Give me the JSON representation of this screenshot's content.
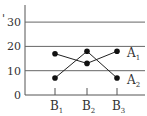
{
  "chart_data": {
    "type": "line",
    "title": "",
    "xlabel": "",
    "ylabel": "",
    "categories": [
      "B1",
      "B2",
      "B3"
    ],
    "category_labels": [
      {
        "main": "B",
        "sub": "1"
      },
      {
        "main": "B",
        "sub": "2"
      },
      {
        "main": "B",
        "sub": "3"
      }
    ],
    "series": [
      {
        "name": "A1",
        "label": {
          "main": "A",
          "sub": "1"
        },
        "values": [
          17,
          13,
          18
        ]
      },
      {
        "name": "A2",
        "label": {
          "main": "A",
          "sub": "2"
        },
        "values": [
          7,
          18,
          7
        ]
      }
    ],
    "yticks": [
      0,
      10,
      20,
      30
    ],
    "ylim": [
      0,
      35
    ],
    "grid": true,
    "legend_position": "inline-right"
  }
}
